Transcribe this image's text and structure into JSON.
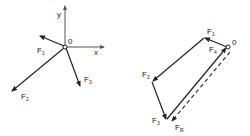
{
  "diagrams": {
    "concurrent_forces": {
      "origin_label": "0",
      "x_axis_label": "x",
      "y_axis_label": "y",
      "forces": [
        {
          "name": "F",
          "sub": "1"
        },
        {
          "name": "F",
          "sub": "2"
        },
        {
          "name": "F",
          "sub": "3"
        }
      ]
    },
    "force_polygon": {
      "origin_label": "0",
      "forces": [
        {
          "name": "F",
          "sub": "1"
        },
        {
          "name": "F",
          "sub": "2"
        },
        {
          "name": "F",
          "sub": "3"
        },
        {
          "name": "F",
          "sub": "4"
        },
        {
          "name": "F",
          "sub": "R"
        }
      ]
    }
  },
  "colors": {
    "stroke": "#222222",
    "axis": "#555555"
  }
}
